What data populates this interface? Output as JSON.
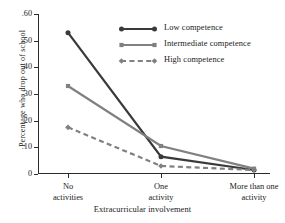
{
  "chart_data": {
    "type": "line",
    "title": "",
    "xlabel": "Extracurricular involvement",
    "ylabel": "Percentage who drop out of school",
    "categories": [
      "No activities",
      "One activity",
      "More than one activity"
    ],
    "category_lines": [
      [
        "No",
        "activities"
      ],
      [
        "One",
        "activity"
      ],
      [
        "More than one",
        "activity"
      ]
    ],
    "ylim": [
      0,
      0.6
    ],
    "ytick_labels": [
      ".60",
      ".50",
      ".40",
      ".30",
      ".20",
      ".10",
      "0"
    ],
    "ytick_values": [
      0.6,
      0.5,
      0.4,
      0.3,
      0.2,
      0.1,
      0
    ],
    "grid": false,
    "legend_position": "upper-right-inside",
    "series": [
      {
        "name": "Low competence",
        "values": [
          0.53,
          0.065,
          0.015
        ],
        "color": "#3a3a3a",
        "marker": "circle",
        "dash": "solid"
      },
      {
        "name": "Intermediate competence",
        "values": [
          0.33,
          0.105,
          0.02
        ],
        "color": "#808080",
        "marker": "square",
        "dash": "solid"
      },
      {
        "name": "High competence",
        "values": [
          0.175,
          0.03,
          0.015
        ],
        "color": "#808080",
        "marker": "diamond",
        "dash": "dashed"
      }
    ]
  },
  "colors": {
    "axis": "#2b2b2b",
    "dark_series": "#3a3a3a",
    "gray_series": "#808080",
    "background": "#ffffff"
  }
}
